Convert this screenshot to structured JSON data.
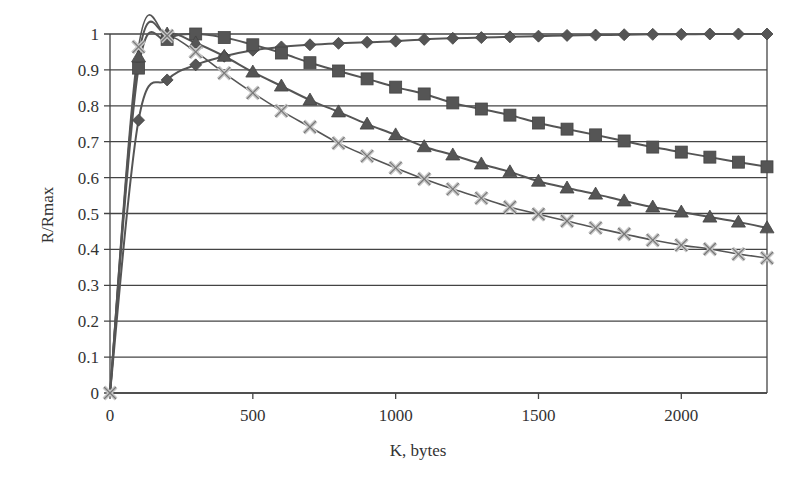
{
  "chart_data": {
    "type": "line",
    "title": "",
    "xlabel": "K, bytes",
    "ylabel": "R/Rmax",
    "xlim": [
      0,
      2300
    ],
    "ylim": [
      0,
      1
    ],
    "grid": {
      "horizontal": true,
      "vertical": false
    },
    "legend": null,
    "x_ticks": [
      0,
      500,
      1000,
      1500,
      2000
    ],
    "x_tick_labels": [
      "0",
      "500",
      "1000",
      "1500",
      "2000"
    ],
    "y_ticks": [
      0,
      0.1,
      0.2,
      0.3,
      0.4,
      0.5,
      0.6,
      0.7,
      0.8,
      0.9,
      1
    ],
    "y_tick_labels": [
      "0",
      "0.1",
      "0.2",
      "0.3",
      "0.4",
      "0.5",
      "0.6",
      "0.7",
      "0.8",
      "0.9",
      "1"
    ],
    "x": [
      0,
      100,
      200,
      300,
      400,
      500,
      600,
      700,
      800,
      900,
      1000,
      1100,
      1200,
      1300,
      1400,
      1500,
      1600,
      1700,
      1800,
      1900,
      2000,
      2100,
      2200,
      2300
    ],
    "series": [
      {
        "name": "diamond",
        "marker": "diamond",
        "color": "#555555",
        "values": [
          0,
          0.76,
          0.872,
          0.914,
          0.938,
          0.955,
          0.964,
          0.97,
          0.974,
          0.977,
          0.98,
          0.985,
          0.988,
          0.99,
          0.992,
          0.994,
          0.996,
          0.997,
          0.998,
          0.999,
          0.999,
          1.0,
          1.0,
          1.0
        ]
      },
      {
        "name": "square",
        "marker": "square",
        "color": "#555555",
        "values": [
          0,
          0.905,
          0.985,
          1.0,
          0.99,
          0.97,
          0.947,
          0.92,
          0.897,
          0.875,
          0.852,
          0.833,
          0.808,
          0.791,
          0.774,
          0.752,
          0.735,
          0.719,
          0.702,
          0.685,
          0.671,
          0.657,
          0.643,
          0.63
        ]
      },
      {
        "name": "triangle",
        "marker": "triangle",
        "color": "#555555",
        "values": [
          0,
          0.936,
          1.0,
          0.975,
          0.938,
          0.894,
          0.855,
          0.816,
          0.783,
          0.749,
          0.719,
          0.686,
          0.663,
          0.638,
          0.616,
          0.59,
          0.571,
          0.554,
          0.535,
          0.518,
          0.504,
          0.49,
          0.476,
          0.46
        ]
      },
      {
        "name": "cross",
        "marker": "x",
        "color": "#bbbbbb",
        "values": [
          0,
          0.964,
          0.995,
          0.95,
          0.891,
          0.836,
          0.786,
          0.741,
          0.696,
          0.66,
          0.627,
          0.596,
          0.568,
          0.543,
          0.518,
          0.498,
          0.479,
          0.46,
          0.443,
          0.426,
          0.412,
          0.401,
          0.387,
          0.376
        ]
      }
    ]
  },
  "style": {
    "line_color": "#555555",
    "grid_color": "#444444",
    "marker_dark": "#555555",
    "marker_light": "#c8c8c8"
  }
}
